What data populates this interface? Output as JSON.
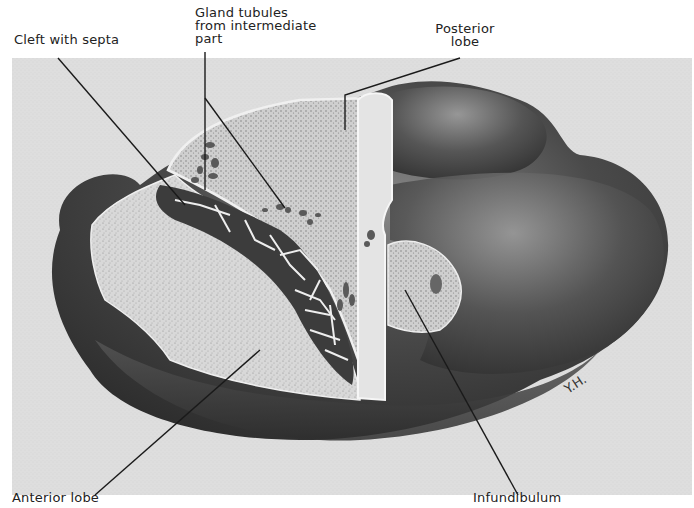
{
  "figure": {
    "signature": "Y.H.",
    "colors": {
      "background_panel": "#dcdcdc",
      "gland_dark": "#3a3a3a",
      "gland_mid": "#6b6b6b",
      "tissue_light": "#cfcfcf",
      "stippled_cut_surface": "#d6d6d6",
      "leader_line": "#1a1a1a"
    }
  },
  "labels": {
    "cleft_with_septa": "Cleft with septa",
    "gland_tubules": "Gland tubules\nfrom intermediate\npart",
    "posterior_lobe": "Posterior\nlobe",
    "anterior_lobe": "Anterior lobe",
    "infundibulum": "Infundibulum"
  }
}
